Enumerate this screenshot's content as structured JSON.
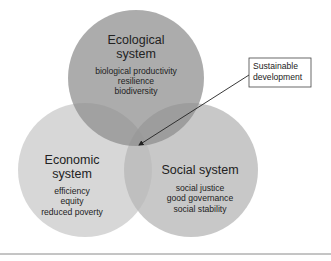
{
  "diagram": {
    "type": "venn",
    "colors": {
      "background": "#ffffff",
      "ecological_fill": "#9a9a9a",
      "economic_fill": "#d3d3d3",
      "social_fill": "#c2c2c2",
      "text": "#222222",
      "rule": "#8a8a8a"
    },
    "circles": [
      {
        "id": "ecological",
        "title_line1": "Ecological",
        "title_line2": "system",
        "items": [
          "biological productivity",
          "resilience",
          "biodiversity"
        ]
      },
      {
        "id": "economic",
        "title_line1": "Economic",
        "title_line2": "system",
        "items": [
          "efficiency",
          "equity",
          "reduced poverty"
        ]
      },
      {
        "id": "social",
        "title_line1": "Social system",
        "items": [
          "social justice",
          "good governance",
          "social stability"
        ]
      }
    ],
    "callout": {
      "line1": "Sustainable",
      "line2": "development",
      "points_to": "center intersection of all three systems"
    }
  }
}
